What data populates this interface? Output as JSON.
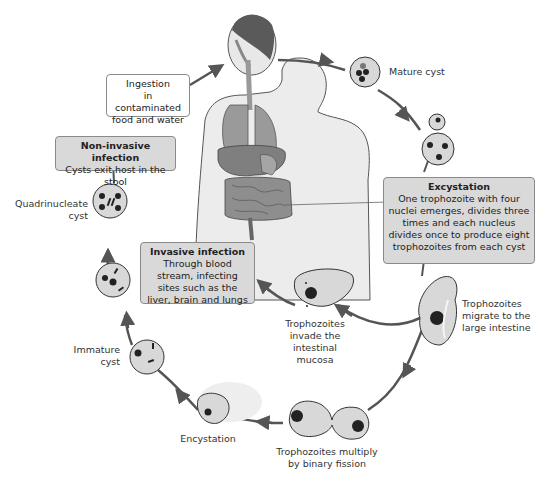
{
  "diagram": {
    "colors": {
      "arrow": "#555555",
      "cell_fill": "#d6d6d6",
      "cell_stroke": "#333333",
      "nucleus": "#222222",
      "box_grey": "#d9d9d9",
      "box_white": "#ffffff",
      "organ_red": "#8a8a8a"
    },
    "boxes": {
      "ingestion": {
        "lines": [
          "Ingestion",
          "in contaminated",
          "food and water"
        ]
      },
      "non_invasive": {
        "title": "Non-invasive infection",
        "body": "Cysts exit host in the stool"
      },
      "excystation": {
        "title": "Excystation",
        "body": "One trophozoite with four nuclei emerges, divides three times and each nucleus divides once to produce eight trophozoites from each cyst"
      },
      "invasive": {
        "title": "Invasive infection",
        "body": "Through blood stream, infecting sites such as the liver, brain and lungs"
      }
    },
    "stages": [
      {
        "id": "mature-cyst",
        "label": "Mature cyst"
      },
      {
        "id": "trophozoites-migrate",
        "label": "Trophozoites migrate to the large intestine"
      },
      {
        "id": "trophozoites-invade",
        "label": "Trophozoites invade the intestinal mucosa"
      },
      {
        "id": "binary-fission",
        "label": "Trophozoites multiply by binary fission"
      },
      {
        "id": "encystation",
        "label": "Encystation"
      },
      {
        "id": "immature-cyst",
        "label": "Immature cyst"
      },
      {
        "id": "quadrinucleate-cyst",
        "label": "Quadrinucleate cyst"
      }
    ],
    "labels": {
      "mature_cyst": "Mature cyst",
      "migrate": [
        "Trophozoites",
        "migrate to the",
        "large intestine"
      ],
      "invade": [
        "Trophozoites",
        "invade the",
        "intestinal",
        "mucosa"
      ],
      "fission": [
        "Trophozoites multiply",
        "by binary fission"
      ],
      "encystation": "Encystation",
      "immature": [
        "Immature",
        "cyst"
      ],
      "quadrinucleate": [
        "Quadrinucleate",
        "cyst"
      ]
    }
  }
}
